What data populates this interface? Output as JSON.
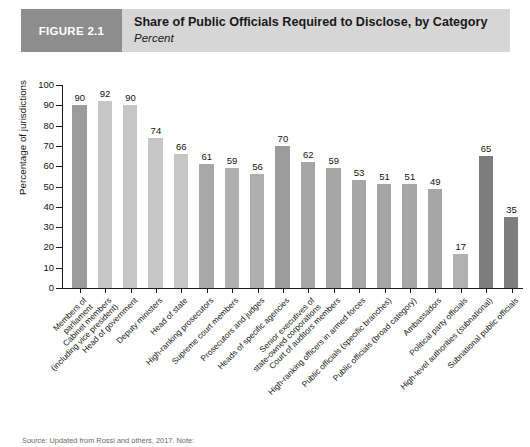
{
  "header": {
    "badge_label": "FIGURE 2.1",
    "title": "Share of Public Officials Required to Disclose, by Category",
    "subtitle": "Percent",
    "badge_color": "#8d8d8d",
    "band_color": "#d6d6d6"
  },
  "source_note": "Source: Updated from Rossi and others, 2017. Note:",
  "chart_data": {
    "type": "bar",
    "title": "Share of Public Officials Required to Disclose, by Category",
    "subtitle": "Percent",
    "xlabel": "",
    "ylabel": "Percentage of jurisdictions",
    "ylim": [
      0,
      100
    ],
    "ytick_labels": [
      "0",
      "10",
      "20",
      "30",
      "40",
      "50",
      "60",
      "70",
      "80",
      "90",
      "100"
    ],
    "yticks": [
      0,
      10,
      20,
      30,
      40,
      50,
      60,
      70,
      80,
      90,
      100
    ],
    "grid": false,
    "legend": "none",
    "categories": [
      "Members of\nparliament",
      "Cabinet members\n(including vice president)",
      "Head of government",
      "Deputy ministers",
      "Head of state",
      "High-ranking prosecutors",
      "Supreme court members",
      "Prosecutors and judges",
      "Heads of specific agencies",
      "Senior executives of\nstate-owned corporations",
      "Court of auditors members",
      "High-ranking officers in armed forces",
      "Public officials (specific branches)",
      "Public officials (broad category)",
      "Ambassadors",
      "Political party officials",
      "High-level authorities (subnational)",
      "Subnational public officials"
    ],
    "values": [
      90,
      92,
      90,
      74,
      66,
      61,
      59,
      56,
      70,
      62,
      59,
      53,
      51,
      51,
      49,
      17,
      65,
      35
    ],
    "bar_colors": [
      "#9b9b9b",
      "#c6c6c6",
      "#c6c6c6",
      "#c6c6c6",
      "#c6c6c6",
      "#a8a8a8",
      "#aeaeae",
      "#aeaeae",
      "#9b9b9b",
      "#a6a6a6",
      "#a6a6a6",
      "#a6a6a6",
      "#a6a6a6",
      "#a6a6a6",
      "#a6a6a6",
      "#b0b0b0",
      "#7d7d7d",
      "#7d7d7d"
    ]
  }
}
